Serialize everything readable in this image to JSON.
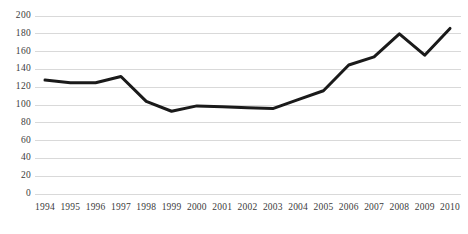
{
  "chart_data": {
    "type": "line",
    "title": "",
    "subtitle": "",
    "xlabel": "",
    "ylabel": "",
    "categories": [
      "1994",
      "1995",
      "1996",
      "1997",
      "1998",
      "1999",
      "2000",
      "2001",
      "2002",
      "2003",
      "2004",
      "2005",
      "2006",
      "2007",
      "2008",
      "2009",
      "2010"
    ],
    "values": [
      128,
      125,
      125,
      132,
      104,
      93,
      99,
      98,
      97,
      96,
      106,
      116,
      145,
      154,
      180,
      156,
      186
    ],
    "series": [
      {
        "name": "",
        "values": [
          128,
          125,
          125,
          132,
          104,
          93,
          99,
          98,
          97,
          96,
          106,
          116,
          145,
          154,
          180,
          156,
          186
        ]
      }
    ],
    "ylim": [
      0,
      200
    ],
    "yticks": [
      0,
      20,
      40,
      60,
      80,
      100,
      120,
      140,
      160,
      180,
      200
    ],
    "ytick_labels": [
      "0",
      "20",
      "40",
      "60",
      "80",
      "100",
      "120",
      "140",
      "160",
      "180",
      "200"
    ],
    "xtick_labels": [
      "1994",
      "1995",
      "1996",
      "1997",
      "1998",
      "1999",
      "2000",
      "2001",
      "2002",
      "2003",
      "2004",
      "2005",
      "2006",
      "2007",
      "2008",
      "2009",
      "2010"
    ],
    "grid": true,
    "grid_axis": "y",
    "legend": false,
    "legend_position": "none",
    "annotations": [],
    "colors": {
      "line": "#1a1a1a",
      "grid": "#d9d9d9",
      "background": "#ffffff",
      "tick_text": "#3b3b3b"
    },
    "line_width": 3
  }
}
